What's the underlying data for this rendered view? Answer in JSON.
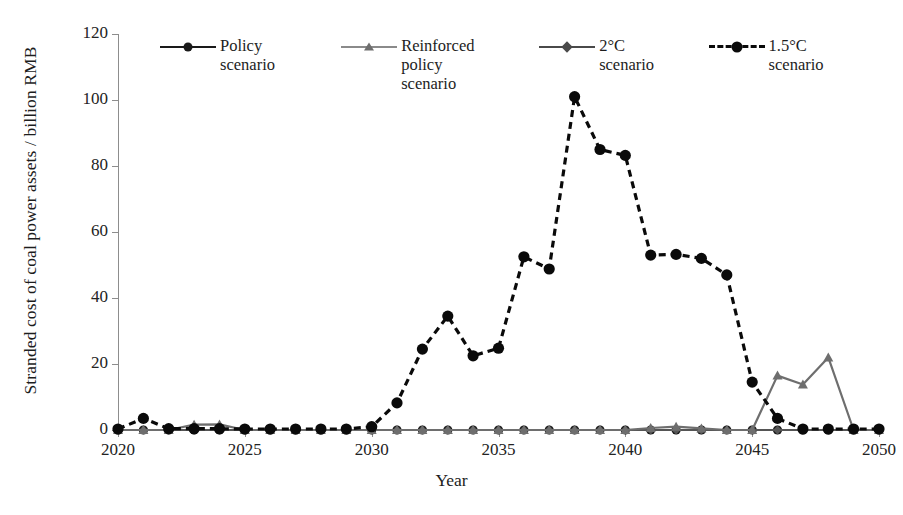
{
  "chart_data": {
    "type": "line",
    "title": "",
    "xlabel": "Year",
    "ylabel": "Stranded cost of coal power assets / billion RMB",
    "xlim": [
      2020,
      2050
    ],
    "ylim": [
      0,
      120
    ],
    "ytick_labels": [
      "0",
      "20",
      "40",
      "60",
      "80",
      "100",
      "120"
    ],
    "ytick_values": [
      0,
      20,
      40,
      60,
      80,
      100,
      120
    ],
    "xtick_labels": [
      "2020",
      "2025",
      "2030",
      "2035",
      "2040",
      "2045",
      "2050"
    ],
    "xtick_values": [
      2020,
      2025,
      2030,
      2035,
      2040,
      2045,
      2050
    ],
    "grid": false,
    "legend_position": "top",
    "x": [
      2020,
      2021,
      2022,
      2023,
      2024,
      2025,
      2026,
      2027,
      2028,
      2029,
      2030,
      2031,
      2032,
      2033,
      2034,
      2035,
      2036,
      2037,
      2038,
      2039,
      2040,
      2041,
      2042,
      2043,
      2044,
      2045,
      2046,
      2047,
      2048,
      2049,
      2050
    ],
    "series": [
      {
        "name": "Policy scenario",
        "color": "#1a1a1a",
        "style": "solid",
        "marker": "circle",
        "values": [
          0,
          0,
          0,
          0,
          0,
          0,
          0,
          0,
          0,
          0,
          0,
          0,
          0,
          0,
          0,
          0,
          0,
          0,
          0,
          0,
          0,
          0,
          0,
          0,
          0,
          0,
          0,
          0,
          0,
          0,
          0
        ]
      },
      {
        "name": "Reinforced policy scenario",
        "color": "#6e6e6e",
        "style": "solid",
        "marker": "triangle",
        "values": [
          0,
          0,
          0,
          1.6,
          1.7,
          0,
          0,
          0,
          0,
          0,
          0,
          0,
          0,
          0,
          0,
          0,
          0,
          0,
          0,
          0,
          0,
          0.6,
          1.0,
          0.5,
          0,
          0,
          16.5,
          13.8,
          22.0,
          0,
          0
        ]
      },
      {
        "name": "2°C scenario",
        "color": "#555555",
        "style": "solid",
        "marker": "diamond",
        "values": [
          0,
          0,
          0,
          0,
          0,
          0,
          0,
          0,
          0,
          0,
          0,
          0,
          0,
          0,
          0,
          0,
          0,
          0,
          0,
          0,
          0,
          0,
          0,
          0,
          0,
          0,
          0,
          0,
          0,
          0,
          0
        ]
      },
      {
        "name": "1.5°C scenario",
        "color": "#0a0a0a",
        "style": "dashed",
        "marker": "circle-large",
        "values": [
          0.3,
          3.5,
          0.4,
          0.4,
          0.4,
          0.3,
          0.3,
          0.3,
          0.3,
          0.3,
          1.0,
          8.2,
          24.5,
          34.5,
          22.5,
          24.8,
          52.5,
          48.8,
          101.0,
          85.0,
          83.2,
          53.0,
          53.2,
          52.0,
          47.0,
          14.5,
          3.5,
          0.3,
          0.3,
          0.3,
          0.3
        ]
      }
    ]
  },
  "axis": {
    "xlabel": "Year",
    "ylabel": "Stranded cost of coal power assets /\nbillion RMB"
  },
  "legend": {
    "items": [
      {
        "label": "Policy scenario"
      },
      {
        "label": "Reinforced policy\nscenario"
      },
      {
        "label": "2°C scenario"
      },
      {
        "label": "1.5°C scenario"
      }
    ]
  }
}
